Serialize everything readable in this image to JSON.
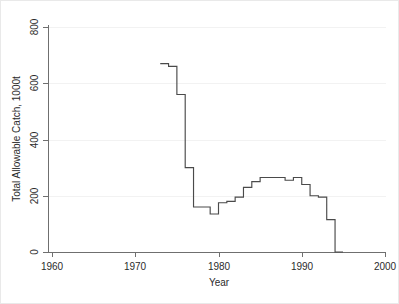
{
  "chart_data": {
    "type": "line",
    "title": "",
    "subtitle": "",
    "xlabel": "Year",
    "ylabel": "Total Allowable Catch, 1000t",
    "xlim": [
      1960,
      2000
    ],
    "ylim": [
      0,
      800
    ],
    "xticks": [
      1960,
      1970,
      1980,
      1990,
      2000
    ],
    "xticklabels": [
      "1960",
      "1970",
      "1980",
      "1990",
      "2000"
    ],
    "yticks": [
      0,
      200,
      400,
      600,
      800
    ],
    "yticklabels": [
      "0",
      "200",
      "400",
      "600",
      "800"
    ],
    "grid": "horizontal-faint",
    "legend": "none",
    "drawstyle": "steps-post",
    "series": [
      {
        "name": "Total Allowable Catch",
        "color": "#4a4a4a",
        "x": [
          1973,
          1974,
          1975,
          1976,
          1977,
          1978,
          1979,
          1980,
          1981,
          1982,
          1983,
          1984,
          1985,
          1986,
          1987,
          1988,
          1989,
          1990,
          1991,
          1992,
          1993,
          1994
        ],
        "values": [
          670,
          660,
          560,
          300,
          160,
          160,
          135,
          175,
          180,
          195,
          230,
          250,
          265,
          265,
          265,
          255,
          265,
          240,
          200,
          195,
          115,
          0
        ]
      }
    ],
    "annotations": []
  },
  "axes": {
    "x_title": "Year",
    "y_title": "Total Allowable Catch, 1000t"
  }
}
